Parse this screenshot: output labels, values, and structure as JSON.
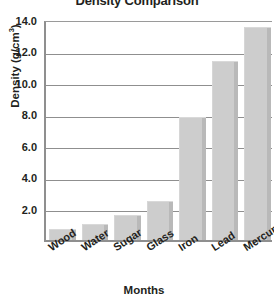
{
  "chart_data": {
    "type": "bar",
    "title": "Density Comparison",
    "xlabel": "Months",
    "ylabel": "Density (g/cm",
    "ylabel_superscript": "3",
    "ylabel_suffix": ")",
    "ylabel_full": "Density (g/cm3)",
    "categories": [
      "Wood",
      "Water",
      "Sugar",
      "Glass",
      "Iron",
      "Lead",
      "Mercury"
    ],
    "values": [
      0.7,
      1.0,
      1.6,
      2.45,
      7.8,
      11.35,
      13.5
    ],
    "series": [
      {
        "name": "Density",
        "values": [
          0.7,
          1.0,
          1.6,
          2.45,
          7.8,
          11.35,
          13.5
        ]
      }
    ],
    "ylim": [
      0,
      14.0
    ],
    "y_ticks": [
      2.0,
      4.0,
      6.0,
      8.0,
      10.0,
      12.0,
      14.0
    ],
    "y_tick_labels": [
      "2.0",
      "4.0",
      "6.0",
      "8.0",
      "10.0",
      "12.0",
      "14.0"
    ],
    "grid": true,
    "legend": "none",
    "bar_color": "#cdcdcd",
    "bar_shadow_color": "#b9b9b9",
    "axis_color": "#8f8f8f",
    "text_color": "#231f20",
    "background_color": "#ffffff"
  }
}
